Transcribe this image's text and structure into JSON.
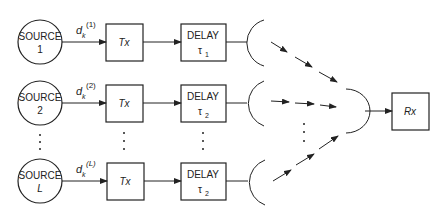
{
  "diagram": {
    "rows": [
      {
        "source_title": "SOURCE",
        "source_index": "1",
        "signal": "d",
        "signal_sub": "k",
        "signal_sup": "(1)",
        "tx": "Tx",
        "delay_title": "DELAY",
        "delay_tau": "τ",
        "delay_sub": "1"
      },
      {
        "source_title": "SOURCE",
        "source_index": "2",
        "signal": "d",
        "signal_sub": "k",
        "signal_sup": "(2)",
        "tx": "Tx",
        "delay_title": "DELAY",
        "delay_tau": "τ",
        "delay_sub": "2"
      },
      {
        "source_title": "SOURCE",
        "source_index": "L",
        "signal": "d",
        "signal_sub": "k",
        "signal_sup": "(L)",
        "tx": "Tx",
        "delay_title": "DELAY",
        "delay_tau": "τ",
        "delay_sub": "2"
      }
    ],
    "receiver": "Rx",
    "colors": {
      "stroke": "#222222",
      "background": "#ffffff"
    }
  }
}
